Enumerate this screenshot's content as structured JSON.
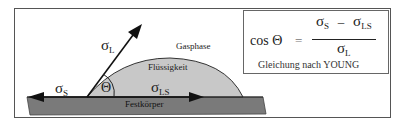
{
  "diagram": {
    "labels": {
      "gas_phase": "Gasphase",
      "liquid": "Flüssigkeit",
      "solid": "Festkörper",
      "theta": "Θ",
      "sigma_L": {
        "symbol": "σ",
        "sub": "L"
      },
      "sigma_S": {
        "symbol": "σ",
        "sub": "S"
      },
      "sigma_LS": {
        "symbol": "σ",
        "sub": "LS"
      }
    },
    "formula": {
      "lhs": "cos Θ",
      "equals": "=",
      "numerator": {
        "a_symbol": "σ",
        "a_sub": "S",
        "op": "–",
        "b_symbol": "σ",
        "b_sub": "LS"
      },
      "denominator": {
        "symbol": "σ",
        "sub": "L"
      },
      "caption": "Gleichung nach YOUNG"
    },
    "colors": {
      "solid": "#7a7a7a",
      "liquid": "#c8c8c8",
      "line": "#222222",
      "frame": "#555555"
    }
  }
}
